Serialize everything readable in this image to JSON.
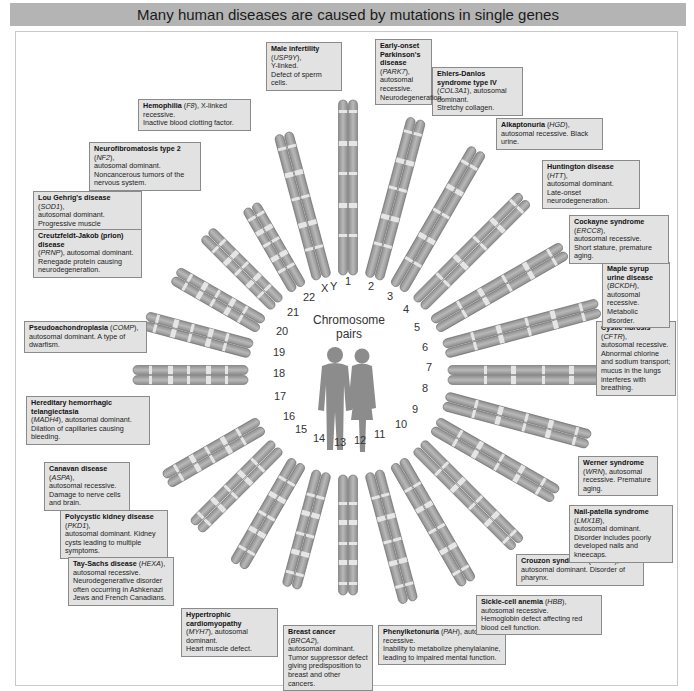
{
  "title": "Many human diseases are caused by mutations in single genes",
  "center": {
    "line1": "Chromosome",
    "line2": "pairs"
  },
  "chromosome_labels": [
    "1",
    "2",
    "3",
    "4",
    "5",
    "6",
    "7",
    "8",
    "9",
    "10",
    "11",
    "12",
    "13",
    "14",
    "15",
    "16",
    "17",
    "18",
    "19",
    "20",
    "21",
    "22",
    "X",
    "Y"
  ],
  "diseases": [
    {
      "id": "park7",
      "name": "Early-onset Parkinson's disease",
      "gene": "PARK7",
      "chromosome": "1",
      "inheritance": "autosomal recessive.",
      "effect": "Neurodegeneration."
    },
    {
      "id": "col3a1",
      "name": "Ehlers-Danlos syndrome type IV",
      "gene": "COL3A1",
      "chromosome": "2",
      "inheritance": "autosomal dominant.",
      "effect": "Stretchy collagen."
    },
    {
      "id": "hgd",
      "name": "Alkaptonuria",
      "gene": "HGD",
      "chromosome": "3",
      "inheritance": "autosomal recessive.",
      "effect": "Black urine."
    },
    {
      "id": "htt",
      "name": "Huntington disease",
      "gene": "HTT",
      "chromosome": "4",
      "inheritance": "autosomal dominant.",
      "effect": "Late-onset neurodegeneration."
    },
    {
      "id": "ercc8",
      "name": "Cockayne syndrome",
      "gene": "ERCC8",
      "chromosome": "5",
      "inheritance": "autosomal recessive.",
      "effect": "Short stature, premature aging."
    },
    {
      "id": "bckdh",
      "name": "Maple syrup urine disease",
      "gene": "BCKDH",
      "chromosome": "6",
      "inheritance": "autosomal recessive.",
      "effect": "Metabolic disorder."
    },
    {
      "id": "cftr",
      "name": "Cystic fibrosis",
      "gene": "CFTR",
      "chromosome": "7",
      "inheritance": "autosomal recessive.",
      "effect": "Abnormal chlorine and sodium transport; mucus in the lungs interferes with breathing."
    },
    {
      "id": "wrn",
      "name": "Werner syndrome",
      "gene": "WRN",
      "chromosome": "8",
      "inheritance": "autosomal recessive.",
      "effect": "Premature aging."
    },
    {
      "id": "lmx1b",
      "name": "Nail-patella syndrome",
      "gene": "LMX1B",
      "chromosome": "9",
      "inheritance": "autosomal dominant.",
      "effect": "Disorder includes poorly developed nails and kneecaps."
    },
    {
      "id": "fgfr2",
      "name": "Crouzon syndrome",
      "gene": "FGFR2",
      "chromosome": "10",
      "inheritance": "autosomal dominant.",
      "effect": "Disorder of pharynx."
    },
    {
      "id": "hbb",
      "name": "Sickle-cell anemia",
      "gene": "HBB",
      "chromosome": "11",
      "inheritance": "autosomal recessive.",
      "effect": "Hemoglobin defect affecting red blood cell function."
    },
    {
      "id": "pah",
      "name": "Phenylketonuria",
      "gene": "PAH",
      "chromosome": "12",
      "inheritance": "autosomal recessive.",
      "effect": "Inability to metabolize phenylalanine, leading to impaired mental function."
    },
    {
      "id": "brca2",
      "name": "Breast cancer",
      "gene": "BRCA2",
      "chromosome": "13",
      "inheritance": "autosomal dominant.",
      "effect": "Tumor suppressor defect giving predisposition to breast and other cancers."
    },
    {
      "id": "myh7",
      "name": "Hypertrophic cardiomyopathy",
      "gene": "MYH7",
      "chromosome": "14",
      "inheritance": "autosomal dominant.",
      "effect": "Heart muscle defect."
    },
    {
      "id": "hexa",
      "name": "Tay-Sachs disease",
      "gene": "HEXA",
      "chromosome": "15",
      "inheritance": "autosomal recessive.",
      "effect": "Neurodegenerative disorder often occurring in Ashkenazi Jews and French Canadians."
    },
    {
      "id": "pkd1",
      "name": "Polycystic kidney disease",
      "gene": "PKD1",
      "chromosome": "16",
      "inheritance": "autosomal dominant.",
      "effect": "Kidney cysts leading to multiple symptoms."
    },
    {
      "id": "aspa",
      "name": "Canavan disease",
      "gene": "ASPA",
      "chromosome": "17",
      "inheritance": "autosomal recessive.",
      "effect": "Damage to nerve cells and brain."
    },
    {
      "id": "madh4",
      "name": "Hereditary hemorrhagic telangiectasia",
      "gene": "MADH4",
      "chromosome": "18",
      "inheritance": "autosomal dominant.",
      "effect": "Dilation of capillaries causing bleeding."
    },
    {
      "id": "comp",
      "name": "Pseudoachondroplasia",
      "gene": "COMP",
      "chromosome": "19",
      "inheritance": "autosomal dominant.",
      "effect": "A type of dwarfism."
    },
    {
      "id": "prnp",
      "name": "Creutzfeldt-Jakob (prion) disease",
      "gene": "PRNP",
      "chromosome": "20",
      "inheritance": "autosomal dominant.",
      "effect": "Renegade protein causing neurodegeneration."
    },
    {
      "id": "sod1",
      "name": "Lou Gehrig's disease",
      "gene": "SOD1",
      "chromosome": "21",
      "inheritance": "autosomal dominant.",
      "effect": "Progressive muscle degeneration."
    },
    {
      "id": "nf2",
      "name": "Neurofibromatosis type 2",
      "gene": "NF2",
      "chromosome": "22",
      "inheritance": "autosomal dominant.",
      "effect": "Noncancerous tumors of the nervous system."
    },
    {
      "id": "f8",
      "name": "Hemophilia",
      "gene": "F8",
      "chromosome": "X",
      "inheritance": "X-linked recessive.",
      "effect": "Inactive blood clotting factor."
    },
    {
      "id": "usp9y",
      "name": "Male infertility",
      "gene": "USP9Y",
      "chromosome": "Y",
      "inheritance": "Y-linked.",
      "effect": "Defect of sperm cells."
    }
  ],
  "colors": {
    "title_bar": "#b4b4b4",
    "box_fill": "#e2e2e2",
    "box_border": "#8a8a8a",
    "chromosome": "#a8a8a8",
    "band": "#e6e6e6",
    "figure": "#8c8c8c"
  }
}
